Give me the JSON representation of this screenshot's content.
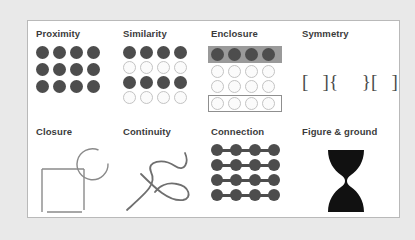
{
  "figure": {
    "panel_background": "#ffffff",
    "page_background": "#e9e9e9",
    "border_color": "#b9b9b9",
    "dark_dot_color": "#4d4d4d",
    "light_dot_color": "#fbfbfb",
    "light_dot_border": "#c3c3c3",
    "band_color": "#9a9a9a",
    "line_color": "#8a8a8a"
  },
  "cells": {
    "proximity": {
      "label": "Proximity",
      "rows": 3,
      "cols": 4,
      "fills": [
        [
          "dark",
          "dark",
          "dark",
          "dark"
        ],
        [
          "dark",
          "dark",
          "dark",
          "dark"
        ],
        [
          "dark",
          "dark",
          "dark",
          "dark"
        ]
      ]
    },
    "similarity": {
      "label": "Similarity",
      "rows": 4,
      "cols": 4,
      "fills": [
        [
          "dark",
          "dark",
          "dark",
          "dark"
        ],
        [
          "light",
          "light",
          "light",
          "light"
        ],
        [
          "dark",
          "dark",
          "dark",
          "dark"
        ],
        [
          "light",
          "light",
          "light",
          "light"
        ]
      ]
    },
    "enclosure": {
      "label": "Enclosure",
      "rows": 4,
      "cols": 4,
      "fills": [
        [
          "dark",
          "dark",
          "dark",
          "dark"
        ],
        [
          "light",
          "light",
          "light",
          "light"
        ],
        [
          "light",
          "light",
          "light",
          "light"
        ],
        [
          "light",
          "light",
          "light",
          "light"
        ]
      ],
      "row_decorations": [
        "band",
        "none",
        "none",
        "boxed"
      ]
    },
    "symmetry": {
      "label": "Symmetry",
      "brackets": "[   ]{     }[   ]"
    },
    "closure": {
      "label": "Closure",
      "shapes": [
        "open-circle",
        "open-square"
      ]
    },
    "continuity": {
      "label": "Continuity",
      "shapes": [
        "crossing-curve-a",
        "crossing-curve-b"
      ]
    },
    "connection": {
      "label": "Connection",
      "rows": 4,
      "cols": 4,
      "fills": [
        [
          "dark",
          "dark",
          "dark",
          "dark"
        ],
        [
          "dark",
          "dark",
          "dark",
          "dark"
        ],
        [
          "dark",
          "dark",
          "dark",
          "dark"
        ],
        [
          "dark",
          "dark",
          "dark",
          "dark"
        ]
      ],
      "connector": "horizontal-bar"
    },
    "figure_ground": {
      "label": "Figure & ground",
      "shapes": [
        "rubin-vase"
      ]
    }
  }
}
